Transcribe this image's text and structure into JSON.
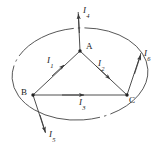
{
  "figure": {
    "type": "physics-circuit-diagram",
    "background_color": "#ffffff",
    "line_color": "#3a3a3a",
    "text_color": "#1a1a1a",
    "width": 163,
    "height": 150,
    "vertices": [
      {
        "name": "A",
        "label": "A",
        "x": 80,
        "y": 51,
        "label_x": 86,
        "label_y": 42
      },
      {
        "name": "B",
        "label": "B",
        "x": 33,
        "y": 95,
        "label_x": 22,
        "label_y": 88
      },
      {
        "name": "C",
        "label": "C",
        "x": 127,
        "y": 95,
        "label_x": 128,
        "label_y": 95
      }
    ],
    "currents": [
      {
        "name": "I1",
        "label": "I",
        "sub": "1",
        "from": "B",
        "to": "A",
        "label_x": 48,
        "label_y": 57
      },
      {
        "name": "I2",
        "label": "I",
        "sub": "2",
        "from": "A",
        "to": "C",
        "label_x": 99,
        "label_y": 60
      },
      {
        "name": "I3",
        "label": "I",
        "sub": "3",
        "from": "B",
        "to": "C",
        "label_x": 80,
        "label_y": 99
      },
      {
        "name": "I4",
        "label": "I",
        "sub": "4",
        "from": "A",
        "to": "outside-top",
        "label_x": 84,
        "label_y": 7
      },
      {
        "name": "I5",
        "label": "I",
        "sub": "5",
        "from": "B",
        "to": "outside-bottom-left",
        "label_x": 50,
        "label_y": 131
      },
      {
        "name": "I6",
        "label": "I",
        "sub": "6",
        "from": "C",
        "to": "outside-top-right",
        "label_x": 145,
        "label_y": 50
      }
    ],
    "loop": {
      "name": "gaussian-loop",
      "style": "dash-dot",
      "center_x": 80,
      "center_y": 74,
      "rx": 68,
      "ry": 46,
      "rotation_deg": -4
    }
  }
}
